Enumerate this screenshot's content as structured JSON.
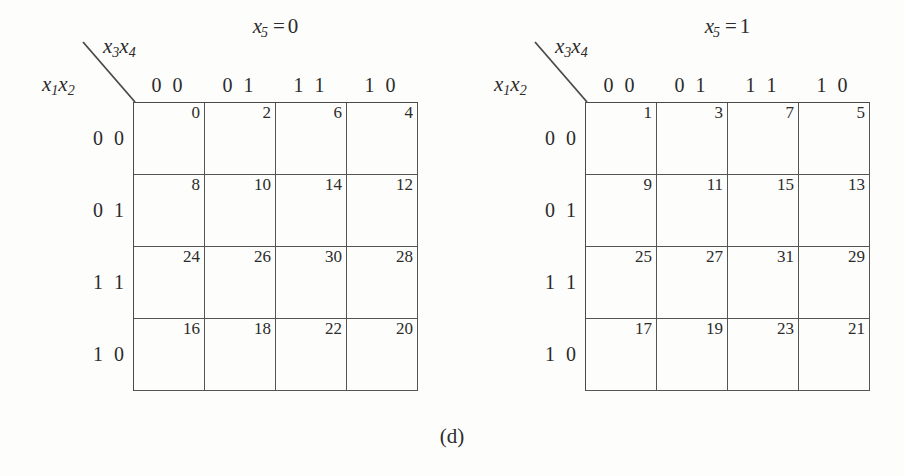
{
  "figure": {
    "caption": "(d)"
  },
  "maps": [
    {
      "id": "kmap-x5-0",
      "title": {
        "var": "x",
        "sub": "5",
        "eq": "=",
        "value": "0"
      },
      "col_axis": {
        "var1": "x",
        "sub1": "3",
        "var2": "x",
        "sub2": "4"
      },
      "row_axis": {
        "var1": "x",
        "sub1": "1",
        "var2": "x",
        "sub2": "2"
      },
      "col_headers": [
        "0 0",
        "0 1",
        "1 1",
        "1 0"
      ],
      "row_headers": [
        "0 0",
        "0 1",
        "1 1",
        "1 0"
      ],
      "cells": [
        [
          "0",
          "2",
          "6",
          "4"
        ],
        [
          "8",
          "10",
          "14",
          "12"
        ],
        [
          "24",
          "26",
          "30",
          "28"
        ],
        [
          "16",
          "18",
          "22",
          "20"
        ]
      ]
    },
    {
      "id": "kmap-x5-1",
      "title": {
        "var": "x",
        "sub": "5",
        "eq": "=",
        "value": "1"
      },
      "col_axis": {
        "var1": "x",
        "sub1": "3",
        "var2": "x",
        "sub2": "4"
      },
      "row_axis": {
        "var1": "x",
        "sub1": "1",
        "var2": "x",
        "sub2": "2"
      },
      "col_headers": [
        "0 0",
        "0 1",
        "1 1",
        "1 0"
      ],
      "row_headers": [
        "0 0",
        "0 1",
        "1 1",
        "1 0"
      ],
      "cells": [
        [
          "1",
          "3",
          "7",
          "5"
        ],
        [
          "9",
          "11",
          "15",
          "13"
        ],
        [
          "25",
          "27",
          "31",
          "29"
        ],
        [
          "17",
          "19",
          "23",
          "21"
        ]
      ]
    }
  ],
  "colors": {
    "background": "#fdfdfb",
    "ink": "#2b2b2b",
    "grid_line": "#555555",
    "grid_outer": "#4a4a4a"
  }
}
